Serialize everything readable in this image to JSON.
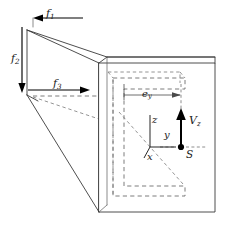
{
  "figure": {
    "colors": {
      "solid_edge": "#3a3a3a",
      "hidden_edge": "#6e6e6e",
      "arrow": "#000000",
      "dimension": "#4a4a4a",
      "background": "#ffffff"
    },
    "line_styles": {
      "visible_edges": "solid",
      "hidden_edges": "dashed",
      "dimension_extension": "dashed"
    }
  },
  "labels": {
    "force_1": {
      "text": "f",
      "sub": "1",
      "direction": "left",
      "description": "axial force component at top back corner"
    },
    "force_2": {
      "text": "f",
      "sub": "2",
      "direction": "down",
      "description": "vertical force component on left end face"
    },
    "force_3": {
      "text": "f",
      "sub": "3",
      "direction": "right",
      "description": "transverse force component into the beam"
    },
    "eccentricity": {
      "text": "e",
      "sub": "y",
      "description": "distance from web to shear centre along y"
    },
    "shear_force": {
      "text": "V",
      "sub": "z",
      "direction": "up",
      "description": "transverse shear force acting at the shear centre"
    },
    "shear_center": {
      "text": "S",
      "description": "shear centre of the channel cross-section"
    },
    "axis_z": {
      "text": "z",
      "direction": "up"
    },
    "axis_y": {
      "text": "y",
      "direction": "right"
    },
    "axis_x": {
      "text": "x",
      "direction": "out-of-plane, down-left"
    }
  },
  "geometry": {
    "cross_section_type": "channel",
    "beam_type": "cantilever prism",
    "front_face": {
      "left": 99,
      "top": 63,
      "right": 215,
      "bottom": 212
    },
    "depth_offset": {
      "dx": -72,
      "dy": -33
    }
  }
}
